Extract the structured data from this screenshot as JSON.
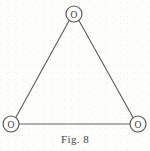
{
  "figure": {
    "caption": "Fig. 8",
    "background_color": "#fdfdfc",
    "line_color": "#5a5a5a",
    "text_color": "#3a3a3a",
    "width": 150,
    "height": 151
  },
  "diagram": {
    "type": "triangular-molecular-structure",
    "nodes": [
      {
        "id": "node-top",
        "label": "O",
        "cx": 74,
        "cy": 14,
        "r": 8
      },
      {
        "id": "node-bottom-left",
        "label": "O",
        "cx": 11,
        "cy": 124,
        "r": 8
      },
      {
        "id": "node-bottom-right",
        "label": "O",
        "cx": 138,
        "cy": 124,
        "r": 8
      }
    ],
    "edges": [
      {
        "id": "edge-top-left",
        "from": "node-top",
        "to": "node-bottom-left"
      },
      {
        "id": "edge-top-right",
        "from": "node-top",
        "to": "node-bottom-right"
      },
      {
        "id": "edge-bottom",
        "from": "node-bottom-left",
        "to": "node-bottom-right"
      }
    ],
    "node_labels": {
      "top": "O",
      "bottom_left": "O",
      "bottom_right": "O"
    }
  }
}
